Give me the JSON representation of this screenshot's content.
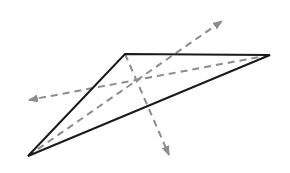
{
  "diagram": {
    "type": "geometric-figure",
    "colors": {
      "background": "#ffffff",
      "triangle_stroke": "#1a1a1a",
      "dashed_lines": "#8c8c8c"
    },
    "triangle": {
      "vertices": [
        {
          "name": "top",
          "x": 125,
          "y": 54
        },
        {
          "name": "right",
          "x": 270,
          "y": 55
        },
        {
          "name": "bottom-left",
          "x": 28,
          "y": 156
        }
      ]
    },
    "center_point": {
      "x": 138,
      "y": 81
    },
    "dashed_arrows": [
      {
        "name": "arrow-upper-right",
        "from": {
          "x": 28,
          "y": 156
        },
        "to": {
          "x": 222,
          "y": 21
        }
      },
      {
        "name": "arrow-left",
        "from": {
          "x": 270,
          "y": 55
        },
        "to": {
          "x": 29,
          "y": 100
        }
      },
      {
        "name": "arrow-down",
        "from": {
          "x": 125,
          "y": 54
        },
        "to": {
          "x": 169,
          "y": 155
        }
      }
    ]
  }
}
